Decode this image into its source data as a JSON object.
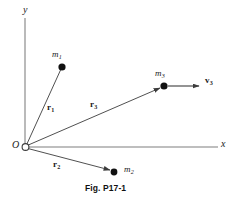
{
  "figure": {
    "caption": "Fig. P17-1",
    "axes": {
      "y_label": "y",
      "x_label": "x",
      "origin_label": "O",
      "axis_color": "#a9a9a9"
    },
    "colors": {
      "line": "#3c3c3c",
      "point": "#111111",
      "text": "#1a1a1a",
      "background": "#ffffff"
    },
    "masses": [
      {
        "name": "m1",
        "symbol": "m",
        "subscript": "1",
        "x": 62,
        "y": 67
      },
      {
        "name": "m2",
        "symbol": "m",
        "subscript": "2",
        "x": 114,
        "y": 172
      },
      {
        "name": "m3",
        "symbol": "m",
        "subscript": "3",
        "x": 164,
        "y": 86
      }
    ],
    "vectors": [
      {
        "name": "r1",
        "symbol": "r",
        "subscript": "1"
      },
      {
        "name": "r2",
        "symbol": "r",
        "subscript": "2"
      },
      {
        "name": "r3",
        "symbol": "r",
        "subscript": "3"
      },
      {
        "name": "v3",
        "symbol": "v",
        "subscript": "3"
      }
    ]
  }
}
